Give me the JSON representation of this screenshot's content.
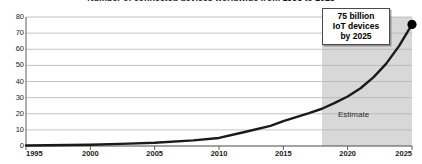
{
  "chart_title": "Number of connected devices worldwide from 1995 to 2025",
  "callout": {
    "line1": "75 billion",
    "line2": "IoT devices",
    "line3": "by 2025"
  },
  "annotations": {
    "estimate": "Estimate"
  },
  "colors": {
    "line": "#1a1a1a",
    "gridline": "#b5b5b5",
    "axis": "#4a4a4a",
    "estimate_band": "#d8d8d8",
    "marker": "#000000",
    "background": "#ffffff"
  },
  "chart_data": {
    "type": "line",
    "title": "Number of connected devices worldwide from 1995 to 2025",
    "xlabel": "",
    "ylabel": "",
    "xlim": [
      1995,
      2025
    ],
    "ylim": [
      0,
      80
    ],
    "grid": true,
    "legend": false,
    "x_ticks": [
      1995,
      2000,
      2005,
      2010,
      2015,
      2020,
      2025
    ],
    "x_tick_labels": [
      "1995",
      "2000",
      "2005",
      "2010",
      "2015",
      "2020",
      "2025"
    ],
    "y_ticks": [
      0,
      10,
      20,
      30,
      40,
      50,
      60,
      70,
      80
    ],
    "y_tick_labels": [
      "0",
      "10",
      "20",
      "30",
      "40",
      "50",
      "60",
      "70",
      "80"
    ],
    "series": [
      {
        "name": "Connected devices (billions)",
        "x": [
          1995,
          2000,
          2003,
          2005,
          2008,
          2010,
          2012,
          2014,
          2015,
          2017,
          2018,
          2019,
          2020,
          2021,
          2022,
          2023,
          2024,
          2025
        ],
        "values": [
          0.3,
          0.8,
          1.5,
          2.0,
          3.5,
          5.0,
          8.7,
          12.5,
          15.4,
          20.4,
          23.1,
          26.7,
          30.7,
          35.8,
          42.6,
          51.1,
          62.1,
          75.4
        ]
      }
    ],
    "markers": [
      {
        "x": 2025,
        "y": 75.4,
        "label": "75 billion IoT devices by 2025"
      }
    ],
    "shaded_regions": [
      {
        "from": 2018,
        "to": 2025,
        "label": "Estimate",
        "color": "#d8d8d8"
      }
    ]
  }
}
